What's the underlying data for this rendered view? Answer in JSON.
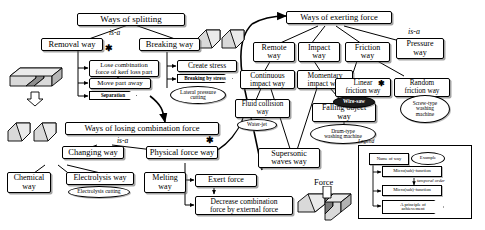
{
  "diagram": {
    "relation_label": "is-a",
    "star_marker": "✱",
    "force_label": "Force"
  },
  "left_tree": {
    "root": "Ways of splitting",
    "isa_label": "is-a",
    "children": [
      "Removal way",
      "Breaking way"
    ],
    "removal_functions": [
      "Lose combination\nforce of kerf loss part",
      "Move part away"
    ],
    "removal_principle": "Separation",
    "breaking_function": "Create stress",
    "breaking_principle": "Breaking by stress",
    "breaking_example": "Lateral pressure\ncutting"
  },
  "lower_left_tree": {
    "root": "Ways of losing combination force",
    "isa_label": "is-a",
    "children": [
      "Changing way",
      "Physical force way"
    ],
    "changing_children": [
      "Chemical\nway",
      "Electrolysis way",
      "Melting\nway"
    ],
    "electrolysis_example": "Electrolysis cutting",
    "physical_functions": [
      "Exert force",
      "Decrease combination\nforce by external force"
    ]
  },
  "right_tree": {
    "root": "Ways of exerting force",
    "isa_label": "is-a",
    "children": [
      "Remote\nway",
      "Impact\nway",
      "Friction\nway",
      "Pressure\nway"
    ],
    "remote_children": [
      "Continuous\nimpact way"
    ],
    "continuous_children": [
      "Fluid collision\nway",
      "Supersonic\nwaves way"
    ],
    "fluid_example": "Water-jet",
    "impact_children": [
      "Momentary\nimpact way"
    ],
    "momentary_children": [
      "Falling object\nway"
    ],
    "falling_example": "Drum-type\nwashing machine",
    "friction_children": [
      "Linear\nfriction way",
      "Random\nfriction way"
    ],
    "linear_example": "Wire-saw",
    "random_example": "Screw-type\nwashing\nmachine"
  },
  "legend": {
    "title": "Legend",
    "name_of_way": "Name of way",
    "example": "Example",
    "micro_function_1": "Micro(sub)-function",
    "temporal_order": "temporal order",
    "micro_function_2": "Micro(sub)-function",
    "principle": "A principle of\nachievement"
  }
}
